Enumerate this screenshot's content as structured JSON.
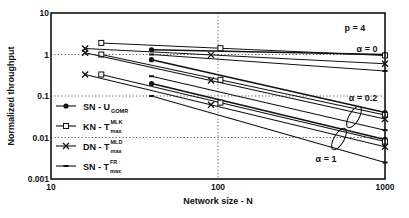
{
  "chart_data": {
    "type": "line",
    "title": "",
    "xlabel": "Network size - N",
    "ylabel": "Normalized throughput",
    "xscale": "log",
    "yscale": "log",
    "xlim": [
      10,
      1000
    ],
    "ylim": [
      0.001,
      10
    ],
    "x_ticks": [
      "10",
      "100",
      "1000"
    ],
    "y_ticks": [
      "0.001",
      "0.01",
      "0.1",
      "1",
      "10"
    ],
    "grid": "dotted reference lines at y=1, y=0.1, y=0.01 and x=100",
    "legend_position": "lower-left inside plot",
    "annotations": [
      "p = 4",
      "α = 0",
      "α = 0.2",
      "α = 1"
    ],
    "legend": [
      {
        "label": "SN - U",
        "sub": "GOMR",
        "sup": "",
        "marker": "filled-circle"
      },
      {
        "label": "KN - T",
        "sub": "max",
        "sup": "MLK",
        "marker": "open-square"
      },
      {
        "label": "DN - T",
        "sub": "max",
        "sup": "MLD",
        "marker": "x"
      },
      {
        "label": "SN - T",
        "sub": "max",
        "sup": "FR",
        "marker": "small-dot"
      }
    ],
    "series": [
      {
        "name": "SN - U_GOMR (α=0)",
        "marker": "filled-circle",
        "x": [
          40,
          1000
        ],
        "values": [
          1.3,
          1.0
        ]
      },
      {
        "name": "KN - T_max^MLK (α=0)",
        "marker": "open-square",
        "x": [
          20,
          1000
        ],
        "values": [
          1.9,
          0.95
        ]
      },
      {
        "name": "DN - T_max^MLD (α=0)",
        "marker": "x",
        "x": [
          16,
          1000
        ],
        "values": [
          1.4,
          0.6
        ]
      },
      {
        "name": "SN - T_max^FR (α=0)",
        "marker": "small-dot",
        "x": [
          40,
          1000
        ],
        "values": [
          1.0,
          0.4
        ]
      },
      {
        "name": "SN - U_GOMR (α=0.2)",
        "marker": "filled-circle",
        "x": [
          40,
          1000
        ],
        "values": [
          0.75,
          0.04
        ]
      },
      {
        "name": "KN - T_max^MLK (α=0.2)",
        "marker": "open-square",
        "x": [
          20,
          1000
        ],
        "values": [
          1.0,
          0.035
        ]
      },
      {
        "name": "DN - T_max^MLD (α=0.2)",
        "marker": "x",
        "x": [
          16,
          1000
        ],
        "values": [
          1.1,
          0.028
        ]
      },
      {
        "name": "SN - T_max^FR (α=0.2)",
        "marker": "small-dot",
        "x": [
          40,
          1000
        ],
        "values": [
          0.3,
          0.015
        ]
      },
      {
        "name": "SN - U_GOMR (α=1)",
        "marker": "filled-circle",
        "x": [
          40,
          1000
        ],
        "values": [
          0.2,
          0.009
        ]
      },
      {
        "name": "KN - T_max^MLK (α=1)",
        "marker": "open-square",
        "x": [
          20,
          1000
        ],
        "values": [
          0.33,
          0.008
        ]
      },
      {
        "name": "DN - T_max^MLD (α=1)",
        "marker": "x",
        "x": [
          16,
          1000
        ],
        "values": [
          0.33,
          0.006
        ]
      },
      {
        "name": "SN - T_max^FR (α=1)",
        "marker": "small-dot",
        "x": [
          40,
          1000
        ],
        "values": [
          0.1,
          0.0025
        ]
      }
    ]
  },
  "labels": {
    "p": "p = 4",
    "alpha0": "α = 0",
    "alpha02": "α = 0.2",
    "alpha1": "α = 1"
  }
}
